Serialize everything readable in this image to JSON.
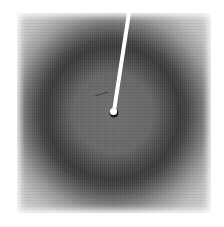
{
  "image": {
    "description": "X-ray fiber/powder diffraction pattern with diffuse dark ring and beam stop",
    "colors": {
      "background": "#ffffff",
      "ring_dark": "#3a3a3a",
      "center_gray": "#6a6a6a",
      "outer_light": "#e4e4e4",
      "beam_stop": "#ffffff"
    },
    "geometry": {
      "pattern_center": [
        113,
        113
      ],
      "ring_radius_px": 66,
      "beam_stop_from": [
        129,
        13
      ],
      "beam_stop_to": [
        114,
        113
      ]
    }
  }
}
